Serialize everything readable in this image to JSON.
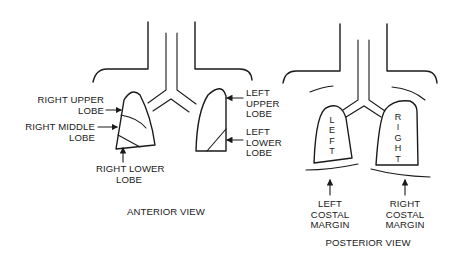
{
  "anterior": {
    "view_label": "ANTERIOR VIEW",
    "labels": {
      "right_upper_lobe": "RIGHT UPPER\nLOBE",
      "right_middle_lobe": "RIGHT MIDDLE\nLOBE",
      "right_lower_lobe": "RIGHT LOWER\nLOBE",
      "left_upper_lobe": "LEFT\nUPPER\nLOBE",
      "left_lower_lobe": "LEFT\nLOWER\nLOBE"
    }
  },
  "posterior": {
    "view_label": "POSTERIOR VIEW",
    "lung_left_text": "L\nE\nF\nT",
    "lung_right_text": "R\nI\nG\nH\nT",
    "labels": {
      "left_costal_margin": "LEFT\nCOSTAL\nMARGIN",
      "right_costal_margin": "RIGHT\nCOSTAL\nMARGIN"
    }
  },
  "colors": {
    "ink": "#1a1a1a",
    "background": "#ffffff"
  }
}
